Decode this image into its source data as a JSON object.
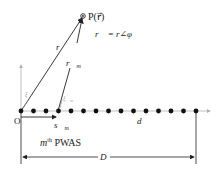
{
  "diagram": {
    "point_label": "P(r⃗)",
    "position_eq": "r⃗ = r∠φ",
    "vector_r": "r⃗",
    "vector_rm": "r⃗",
    "vector_rm_sub": "m",
    "vector_sm": "s⃗",
    "vector_sm_sub": "m",
    "origin_label": "O",
    "spacing_label": "d",
    "element_label_m": "m",
    "element_label_sup": "th",
    "element_label_rest": " PWAS",
    "aperture_label": "D",
    "unit_xi": "ξ⃗",
    "unit_xi_m_sub": "m",
    "num_elements": 15,
    "colors": {
      "line": "#222222",
      "axis": "#b0b0b0",
      "dot": "#111111",
      "gray_text": "#9a9a9a"
    }
  }
}
